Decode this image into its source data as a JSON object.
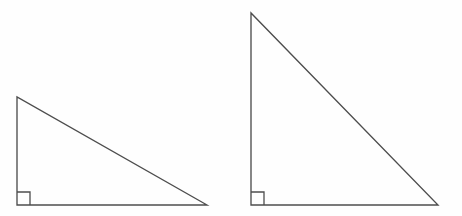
{
  "figure": {
    "background_color": "#fefefe",
    "stroke_color": "#4d4d4d",
    "stroke_width": 1.35,
    "canvas": {
      "width": 462,
      "height": 216
    },
    "shapes": [
      {
        "name": "left-triangle",
        "type": "right-triangle",
        "label": "",
        "vertices": [
          {
            "name": "apex",
            "x": 17,
            "y": 97
          },
          {
            "name": "right-angle-vertex",
            "x": 17,
            "y": 205
          },
          {
            "name": "base-right",
            "x": 207,
            "y": 205
          }
        ],
        "points_attr": "17,97 17,205 207,205",
        "legs": {
          "vertical": 108,
          "horizontal": 190
        },
        "right_angle_marker": {
          "name": "left-right-angle-marker",
          "size": 13,
          "points_attr": "17,192 30,192 30,205"
        }
      },
      {
        "name": "right-triangle",
        "type": "right-triangle",
        "label": "",
        "vertices": [
          {
            "name": "apex",
            "x": 251,
            "y": 13
          },
          {
            "name": "right-angle-vertex",
            "x": 251,
            "y": 205
          },
          {
            "name": "base-right",
            "x": 438,
            "y": 205
          }
        ],
        "points_attr": "251,13 251,205 438,205",
        "legs": {
          "vertical": 192,
          "horizontal": 187
        },
        "right_angle_marker": {
          "name": "right-right-angle-marker",
          "size": 13,
          "points_attr": "251,192 264,192 264,205"
        }
      }
    ]
  }
}
